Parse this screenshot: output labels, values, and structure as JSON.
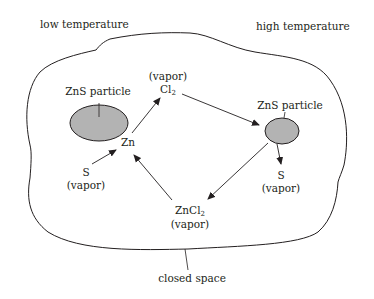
{
  "regions": {
    "low_temperature": "low temperature",
    "high_temperature": "high temperature",
    "closed_space": "closed space"
  },
  "particles": {
    "left": {
      "label": "ZnS particle",
      "fill": "#b3b3b3"
    },
    "right": {
      "label": "ZnS particle",
      "fill": "#b3b3b3"
    }
  },
  "species": {
    "zn": "Zn",
    "cl2_state": "(vapor)",
    "cl2_base": "Cl",
    "cl2_sub": "2",
    "s_left": "S",
    "s_left_state": "(vapor)",
    "s_right": "S",
    "s_right_state": "(vapor)",
    "zncl2_base": "ZnCl",
    "zncl2_sub": "2",
    "zncl2_state": "(vapor)"
  },
  "colors": {
    "line": "#231f20",
    "particle_fill": "#b3b3b3"
  }
}
